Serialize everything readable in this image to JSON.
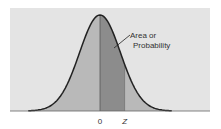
{
  "chart_data": {
    "type": "area",
    "title": "",
    "distribution": "normal",
    "mean": 0,
    "sd": 1,
    "x_range": [
      -3.5,
      3.5
    ],
    "shaded_region": {
      "from": 0,
      "to": 1.2
    },
    "annotation": "Area or Probability",
    "tick_labels": [
      {
        "value": 0,
        "label": "0"
      },
      {
        "value": 1.2,
        "label": "Z"
      }
    ],
    "xlabel": "",
    "ylabel": "",
    "grid": false,
    "colors": {
      "panel": "#e4e4e4",
      "tails": "#b9b9b9",
      "shaded": "#8c8c8c",
      "curve": "#222222",
      "baseline": "#666666"
    }
  }
}
